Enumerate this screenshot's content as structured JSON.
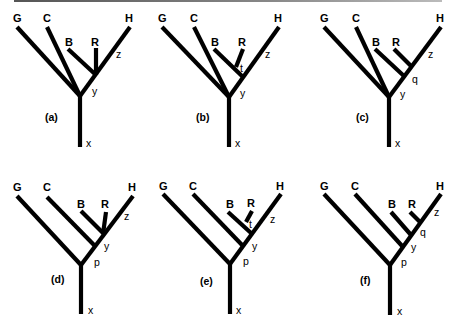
{
  "figure": {
    "panels": [
      {
        "id": "a",
        "caption": "(a)",
        "taxa": {
          "G": "G",
          "C": "C",
          "B": "B",
          "R": "R",
          "H": "H"
        },
        "nodes": {
          "z": "z",
          "y": "y",
          "x": "x"
        }
      },
      {
        "id": "b",
        "caption": "(b)",
        "taxa": {
          "G": "G",
          "C": "C",
          "B": "B",
          "R": "R",
          "H": "H"
        },
        "nodes": {
          "t": "t",
          "z": "z",
          "y": "y",
          "x": "x"
        }
      },
      {
        "id": "c",
        "caption": "(c)",
        "taxa": {
          "G": "G",
          "C": "C",
          "B": "B",
          "R": "R",
          "H": "H"
        },
        "nodes": {
          "z": "z",
          "q": "q",
          "y": "y",
          "x": "x"
        }
      },
      {
        "id": "d",
        "caption": "(d)",
        "taxa": {
          "G": "G",
          "C": "C",
          "B": "B",
          "R": "R",
          "H": "H"
        },
        "nodes": {
          "z": "z",
          "y": "y",
          "p": "p",
          "x": "x"
        }
      },
      {
        "id": "e",
        "caption": "(e)",
        "taxa": {
          "G": "G",
          "C": "C",
          "B": "B",
          "R": "R",
          "H": "H"
        },
        "nodes": {
          "t": "t",
          "z": "z",
          "y": "y",
          "p": "p",
          "x": "x"
        }
      },
      {
        "id": "f",
        "caption": "(f)",
        "taxa": {
          "G": "G",
          "C": "C",
          "B": "B",
          "R": "R",
          "H": "H"
        },
        "nodes": {
          "z": "z",
          "q": "q",
          "y": "y",
          "p": "p",
          "x": "x"
        }
      }
    ]
  }
}
